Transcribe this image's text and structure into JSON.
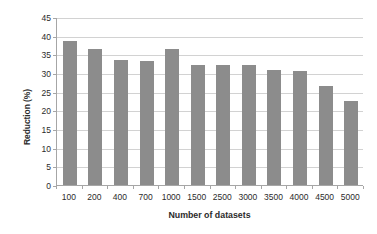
{
  "chart_data": {
    "type": "bar",
    "title": "",
    "xlabel": "Number of datasets",
    "ylabel": "Reduction (%)",
    "categories": [
      "100",
      "200",
      "400",
      "700",
      "1000",
      "1500",
      "2500",
      "3000",
      "3500",
      "4000",
      "4500",
      "5000"
    ],
    "values": [
      38.8,
      36.7,
      33.8,
      33.6,
      36.7,
      32.4,
      32.3,
      32.4,
      31.2,
      30.8,
      26.8,
      22.8
    ],
    "ylim": [
      0,
      45
    ],
    "ytick_labels": [
      "0",
      "5",
      "10",
      "15",
      "20",
      "25",
      "30",
      "35",
      "40",
      "45"
    ],
    "ytick_values": [
      0,
      5,
      10,
      15,
      20,
      25,
      30,
      35,
      40,
      45
    ],
    "grid": true,
    "grid_axis": "y",
    "legend": false,
    "legend_position": "none",
    "bar_color": "#8c8c8c",
    "grid_color": "#d2d2d2",
    "axis_color": "#a6a6a6",
    "background_color": "#ffffff"
  }
}
